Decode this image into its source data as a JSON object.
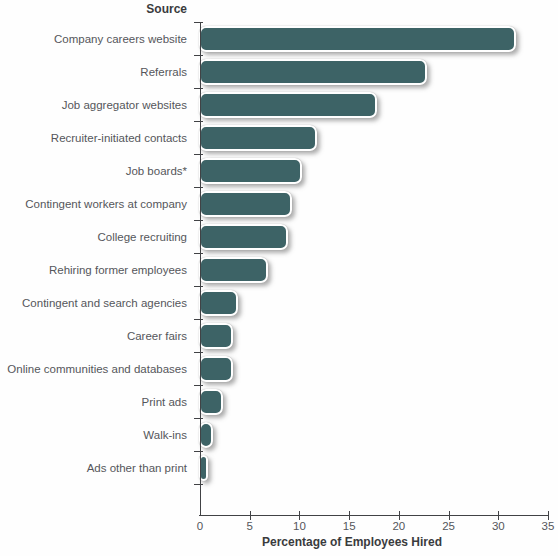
{
  "chart_data": {
    "type": "bar",
    "orientation": "horizontal",
    "y_axis_header": "Source",
    "xlabel": "Percentage of Employees Hired",
    "categories": [
      "Company careers website",
      "Referrals",
      "Job aggregator websites",
      "Recruiter-initiated contacts",
      "Job boards*",
      "Contingent workers at company",
      "College recruiting",
      "Rehiring former employees",
      "Contingent and search agencies",
      "Career fairs",
      "Online communities and databases",
      "Print ads",
      "Walk-ins",
      "Ads other than print"
    ],
    "values": [
      31.5,
      22.5,
      17.5,
      11.5,
      10,
      9,
      8.5,
      6.5,
      3.5,
      3,
      3,
      2,
      1,
      0.5
    ],
    "xlim": [
      0,
      35
    ],
    "xticks": [
      0,
      5,
      10,
      15,
      20,
      25,
      30,
      35
    ],
    "grid": "off",
    "legend": "none",
    "bar_color": "#3d6366",
    "bar_outline_color": "#ffffff",
    "axis_color": "#414245",
    "label_color": "#55565b",
    "bold_label_color": "#3a3b3d"
  }
}
